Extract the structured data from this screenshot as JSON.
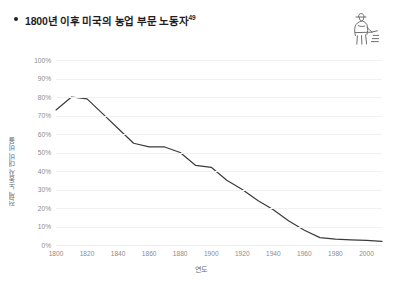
{
  "header": {
    "bullet": "•",
    "title": "1800년 이후 미국의 농업 부문 노동자",
    "footnote": "49",
    "icon_name": "farmer-icon"
  },
  "chart_data": {
    "type": "line",
    "title": "1800년 이후 미국의 농업 부문 노동자",
    "xlabel": "연도",
    "ylabel": "전체 노동자 대비 비율",
    "xlim": [
      1800,
      2010
    ],
    "ylim": [
      0,
      100
    ],
    "grid": true,
    "legend": "none",
    "line_color": "#3b3b3b",
    "x_ticks": [
      1800,
      1820,
      1840,
      1860,
      1880,
      1900,
      1920,
      1940,
      1960,
      1980,
      2000
    ],
    "y_ticks": [
      0,
      10,
      20,
      30,
      40,
      50,
      60,
      70,
      80,
      90,
      100
    ],
    "y_tick_labels": [
      "0%",
      "10%",
      "20%",
      "30%",
      "40%",
      "50%",
      "60%",
      "70%",
      "80%",
      "90%",
      "100%"
    ],
    "x_tick_labels": [
      "1800",
      "1820",
      "1840",
      "1860",
      "1880",
      "1900",
      "1920",
      "1940",
      "1960",
      "1980",
      "2000"
    ],
    "series": [
      {
        "name": "농업 노동자 비율",
        "x": [
          1800,
          1810,
          1820,
          1830,
          1840,
          1850,
          1860,
          1870,
          1880,
          1890,
          1900,
          1910,
          1920,
          1930,
          1940,
          1950,
          1960,
          1970,
          1980,
          1990,
          2000,
          2010
        ],
        "values": [
          73,
          80,
          79,
          71,
          63,
          55,
          53,
          53,
          50,
          43,
          42,
          35,
          30,
          24,
          19,
          13,
          8,
          4,
          3.2,
          2.8,
          2.5,
          2
        ]
      }
    ]
  }
}
